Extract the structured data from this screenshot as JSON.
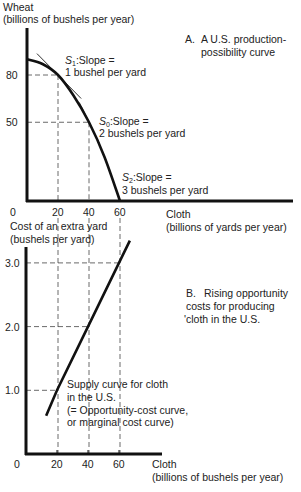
{
  "chart_data": [
    {
      "type": "line",
      "panel_label": "A.",
      "title_lines": [
        "A U.S. production-",
        "possibility curve"
      ],
      "ylabel_lines": [
        "Wheat",
        "(billions of bushels per year)"
      ],
      "xlabel_lines": [
        "Cloth",
        "(billions of yards per year)"
      ],
      "origin_label": "0",
      "x_ticks": [
        "20",
        "40",
        "60"
      ],
      "x_tick_values": [
        20,
        40,
        60
      ],
      "y_ticks": [
        "80",
        "50"
      ],
      "y_tick_values": [
        80,
        50
      ],
      "xlim": [
        0,
        80
      ],
      "ylim": [
        0,
        120
      ],
      "series": [
        {
          "name": "Production-possibility curve",
          "x": [
            0,
            10,
            20,
            30,
            40,
            50,
            60
          ],
          "y": [
            90,
            87,
            80,
            67,
            50,
            28,
            0
          ]
        }
      ],
      "annotations": [
        {
          "id": "s1",
          "sym": "S",
          "sub": "1",
          "lines": [
            ":Slope =",
            "1 bushel per yard"
          ],
          "at_x": 20,
          "at_y": 80,
          "slope": 1
        },
        {
          "id": "s0",
          "sym": "S",
          "sub": "0",
          "lines": [
            ":Slope =",
            "2 bushels per yard"
          ],
          "at_x": 40,
          "at_y": 50,
          "slope": 2
        },
        {
          "id": "s2",
          "sym": "S",
          "sub": "2",
          "lines": [
            ":Slope =",
            "3 bushels per yard"
          ],
          "at_x": 60,
          "at_y": 0,
          "slope": 3
        }
      ],
      "grid": false
    },
    {
      "type": "line",
      "panel_label": "B.",
      "title_lines": [
        "Rising opportunity",
        "costs for producing",
        "'cloth in the U.S."
      ],
      "ylabel_lines": [
        "Cost of an extra yard",
        "(bushels per yard)"
      ],
      "xlabel_lines": [
        "Cloth",
        "(billions of bushels per year)"
      ],
      "origin_label": "0",
      "x_ticks": [
        "20",
        "40",
        "60"
      ],
      "x_tick_values": [
        20,
        40,
        60
      ],
      "y_ticks": [
        "3.0",
        "2.0",
        "1.0"
      ],
      "y_tick_values": [
        3.0,
        2.0,
        1.0
      ],
      "xlim": [
        0,
        60
      ],
      "ylim": [
        0,
        3.3
      ],
      "series": [
        {
          "name": "Supply curve for cloth in the U.S.",
          "x": [
            13,
            20,
            40,
            60,
            67
          ],
          "y": [
            0.6,
            1.0,
            2.0,
            3.0,
            3.35
          ]
        }
      ],
      "annotations": [
        {
          "id": "supply",
          "lines": [
            "Supply curve for cloth",
            "in the U.S.",
            "(= Opportunity-cost curve,",
            "or marginal cost curve)"
          ]
        }
      ],
      "grid": false
    }
  ]
}
